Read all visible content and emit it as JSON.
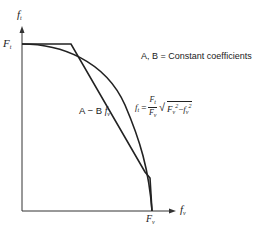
{
  "diagram": {
    "y_axis_label": "f",
    "y_axis_label_sub": "t",
    "x_axis_label": "f",
    "x_axis_label_sub": "v",
    "y_intercept_label": "F",
    "y_intercept_label_sub": "t",
    "x_intercept_label": "F",
    "x_intercept_label_sub": "v",
    "legend_note": "A, B = Constant coefficients",
    "linear_curve_label": "A − B",
    "linear_curve_var": "f",
    "linear_curve_var_sub": "v",
    "ellipse_eq_lhs": "f",
    "ellipse_eq_lhs_sub": "t",
    "ellipse_eq_equals": "=",
    "ellipse_eq_frac_num": "F",
    "ellipse_eq_frac_num_sub": "t",
    "ellipse_eq_frac_den": "F",
    "ellipse_eq_frac_den_sub": "v",
    "ellipse_eq_sqrt": "√",
    "ellipse_eq_term1": "F",
    "ellipse_eq_term1_sub": "v",
    "ellipse_eq_term1_sup": "2",
    "ellipse_eq_minus": "−",
    "ellipse_eq_term2": "f",
    "ellipse_eq_term2_sub": "v",
    "ellipse_eq_term2_sup": "2",
    "line_color": "#222222"
  }
}
